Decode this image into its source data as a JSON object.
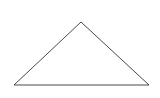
{
  "diagram": {
    "shape": "triangle",
    "stroke_color": "#4a4a4a",
    "fill_color": "#ffffff",
    "stroke_width": 1,
    "points": [
      [
        81,
        22
      ],
      [
        14,
        85
      ],
      [
        149,
        85
      ]
    ],
    "points_attr": "81,22 14,85 149,85"
  }
}
